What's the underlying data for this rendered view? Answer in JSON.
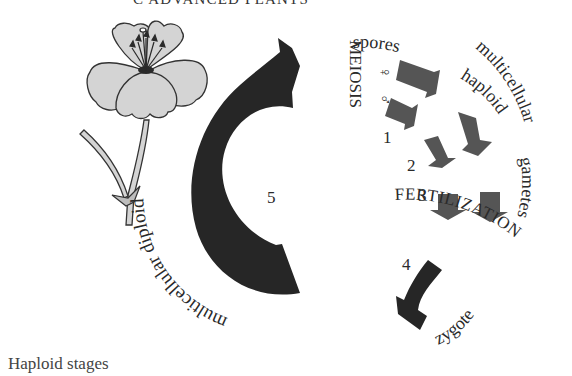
{
  "header": {
    "title": "C ADVANCED PLANTS"
  },
  "diagram": {
    "colors": {
      "big_arrow": "#262626",
      "small_arrows": "#555555",
      "flower_fill": "#d4d4d4",
      "outline": "#333333",
      "text": "#2a2a2a"
    },
    "labels": {
      "meiosis": "MEIOSIS",
      "female_symbol": "♀",
      "male_symbol": "♂",
      "spores": "spores",
      "multicellular_haploid_1": "multicellular",
      "multicellular_haploid_2": "haploid",
      "gametes": "gametes",
      "fertilization": "FERTILIZATION",
      "zygote": "zygote",
      "multicellular_diploid": "multicellular diploid"
    },
    "steps": {
      "s1": "1",
      "s2": "2",
      "s3": "3",
      "s4": "4",
      "s5": "5"
    }
  },
  "caption": {
    "text": "Haploid stages"
  }
}
